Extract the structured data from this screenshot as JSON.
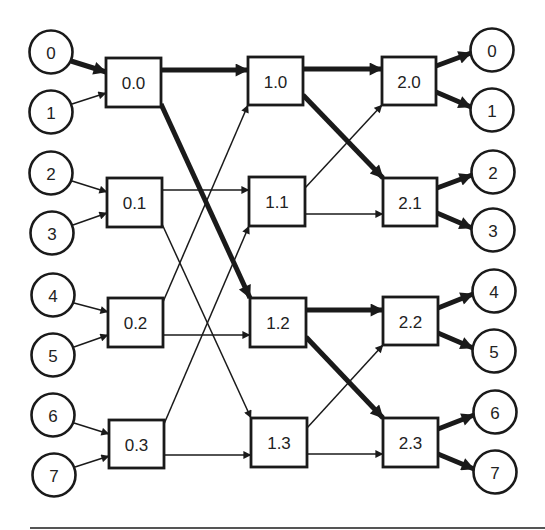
{
  "diagram": {
    "title": "",
    "type": "butterfly-network",
    "colors": {
      "stroke": "#1a1a1a",
      "fill": "#ffffff",
      "text": "#222222"
    },
    "inputs": [
      {
        "id": "in0",
        "label": "0",
        "cx": 51,
        "cy": 52
      },
      {
        "id": "in1",
        "label": "1",
        "cx": 51,
        "cy": 112
      },
      {
        "id": "in2",
        "label": "2",
        "cx": 51,
        "cy": 173
      },
      {
        "id": "in3",
        "label": "3",
        "cx": 52,
        "cy": 233
      },
      {
        "id": "in4",
        "label": "4",
        "cx": 53,
        "cy": 295
      },
      {
        "id": "in5",
        "label": "5",
        "cx": 53,
        "cy": 355
      },
      {
        "id": "in6",
        "label": "6",
        "cx": 53,
        "cy": 415
      },
      {
        "id": "in7",
        "label": "7",
        "cx": 54,
        "cy": 475
      }
    ],
    "stages": [
      {
        "name": "stage-0",
        "switches": [
          {
            "id": "s00",
            "label": "0.0",
            "x": 106,
            "y": 58,
            "w": 55,
            "h": 49
          },
          {
            "id": "s01",
            "label": "0.1",
            "x": 107,
            "y": 178,
            "w": 55,
            "h": 49
          },
          {
            "id": "s02",
            "label": "0.2",
            "x": 108,
            "y": 298,
            "w": 55,
            "h": 49
          },
          {
            "id": "s03",
            "label": "0.3",
            "x": 109,
            "y": 420,
            "w": 55,
            "h": 48
          }
        ]
      },
      {
        "name": "stage-1",
        "switches": [
          {
            "id": "s10",
            "label": "1.0",
            "x": 248,
            "y": 57,
            "w": 55,
            "h": 48
          },
          {
            "id": "s11",
            "label": "1.1",
            "x": 249,
            "y": 177,
            "w": 56,
            "h": 49
          },
          {
            "id": "s12",
            "label": "1.2",
            "x": 250,
            "y": 298,
            "w": 56,
            "h": 49
          },
          {
            "id": "s13",
            "label": "1.3",
            "x": 251,
            "y": 418,
            "w": 56,
            "h": 49
          }
        ]
      },
      {
        "name": "stage-2",
        "switches": [
          {
            "id": "s20",
            "label": "2.0",
            "x": 382,
            "y": 57,
            "w": 54,
            "h": 48
          },
          {
            "id": "s21",
            "label": "2.1",
            "x": 383,
            "y": 178,
            "w": 54,
            "h": 48
          },
          {
            "id": "s22",
            "label": "2.2",
            "x": 383,
            "y": 297,
            "w": 55,
            "h": 48
          },
          {
            "id": "s23",
            "label": "2.3",
            "x": 383,
            "y": 418,
            "w": 55,
            "h": 49
          }
        ]
      }
    ],
    "outputs": [
      {
        "id": "out0",
        "label": "0",
        "cx": 492,
        "cy": 50
      },
      {
        "id": "out1",
        "label": "1",
        "cx": 492,
        "cy": 110
      },
      {
        "id": "out2",
        "label": "2",
        "cx": 493,
        "cy": 172
      },
      {
        "id": "out3",
        "label": "3",
        "cx": 493,
        "cy": 230
      },
      {
        "id": "out4",
        "label": "4",
        "cx": 494,
        "cy": 291
      },
      {
        "id": "out5",
        "label": "5",
        "cx": 494,
        "cy": 351
      },
      {
        "id": "out6",
        "label": "6",
        "cx": 495,
        "cy": 412
      },
      {
        "id": "out7",
        "label": "7",
        "cx": 495,
        "cy": 472
      }
    ],
    "edges": [
      {
        "from": "in0",
        "to": "s00",
        "thick": true,
        "x1": 71,
        "y1": 61,
        "x2": 106,
        "y2": 72
      },
      {
        "from": "in1",
        "to": "s00",
        "thick": false,
        "x1": 72,
        "y1": 104,
        "x2": 106,
        "y2": 93
      },
      {
        "from": "in2",
        "to": "s01",
        "thick": false,
        "x1": 72,
        "y1": 181,
        "x2": 107,
        "y2": 192
      },
      {
        "from": "in3",
        "to": "s01",
        "thick": false,
        "x1": 73,
        "y1": 225,
        "x2": 107,
        "y2": 213
      },
      {
        "from": "in4",
        "to": "s02",
        "thick": false,
        "x1": 74,
        "y1": 303,
        "x2": 108,
        "y2": 312
      },
      {
        "from": "in5",
        "to": "s02",
        "thick": false,
        "x1": 74,
        "y1": 347,
        "x2": 108,
        "y2": 335
      },
      {
        "from": "in6",
        "to": "s03",
        "thick": false,
        "x1": 74,
        "y1": 423,
        "x2": 109,
        "y2": 434
      },
      {
        "from": "in7",
        "to": "s03",
        "thick": false,
        "x1": 75,
        "y1": 467,
        "x2": 109,
        "y2": 456
      },
      {
        "from": "s00",
        "to": "s10",
        "thick": true,
        "x1": 161,
        "y1": 70,
        "x2": 248,
        "y2": 70
      },
      {
        "from": "s00",
        "to": "s12",
        "thick": true,
        "x1": 161,
        "y1": 104,
        "x2": 250,
        "y2": 298
      },
      {
        "from": "s01",
        "to": "s11",
        "thick": false,
        "x1": 162,
        "y1": 190,
        "x2": 249,
        "y2": 190
      },
      {
        "from": "s01",
        "to": "s13",
        "thick": false,
        "x1": 162,
        "y1": 224,
        "x2": 251,
        "y2": 418
      },
      {
        "from": "s02",
        "to": "s10",
        "thick": false,
        "x1": 163,
        "y1": 302,
        "x2": 248,
        "y2": 105
      },
      {
        "from": "s02",
        "to": "s12",
        "thick": false,
        "x1": 163,
        "y1": 335,
        "x2": 250,
        "y2": 335
      },
      {
        "from": "s03",
        "to": "s11",
        "thick": false,
        "x1": 164,
        "y1": 424,
        "x2": 249,
        "y2": 226
      },
      {
        "from": "s03",
        "to": "s13",
        "thick": false,
        "x1": 164,
        "y1": 455,
        "x2": 251,
        "y2": 455
      },
      {
        "from": "s10",
        "to": "s20",
        "thick": true,
        "x1": 303,
        "y1": 69,
        "x2": 382,
        "y2": 69
      },
      {
        "from": "s10",
        "to": "s21",
        "thick": true,
        "x1": 303,
        "y1": 95,
        "x2": 383,
        "y2": 178
      },
      {
        "from": "s11",
        "to": "s20",
        "thick": false,
        "x1": 305,
        "y1": 188,
        "x2": 382,
        "y2": 105
      },
      {
        "from": "s11",
        "to": "s21",
        "thick": false,
        "x1": 305,
        "y1": 214,
        "x2": 383,
        "y2": 214
      },
      {
        "from": "s12",
        "to": "s22",
        "thick": true,
        "x1": 306,
        "y1": 310,
        "x2": 383,
        "y2": 310
      },
      {
        "from": "s12",
        "to": "s23",
        "thick": true,
        "x1": 306,
        "y1": 337,
        "x2": 383,
        "y2": 418
      },
      {
        "from": "s13",
        "to": "s22",
        "thick": false,
        "x1": 307,
        "y1": 428,
        "x2": 383,
        "y2": 345
      },
      {
        "from": "s13",
        "to": "s23",
        "thick": false,
        "x1": 307,
        "y1": 454,
        "x2": 383,
        "y2": 454
      },
      {
        "from": "s20",
        "to": "out0",
        "thick": true,
        "x1": 436,
        "y1": 66,
        "x2": 471,
        "y2": 53
      },
      {
        "from": "s20",
        "to": "out1",
        "thick": true,
        "x1": 436,
        "y1": 92,
        "x2": 471,
        "y2": 107
      },
      {
        "from": "s21",
        "to": "out2",
        "thick": true,
        "x1": 437,
        "y1": 188,
        "x2": 472,
        "y2": 175
      },
      {
        "from": "s21",
        "to": "out3",
        "thick": true,
        "x1": 437,
        "y1": 213,
        "x2": 472,
        "y2": 228
      },
      {
        "from": "s22",
        "to": "out4",
        "thick": true,
        "x1": 438,
        "y1": 308,
        "x2": 473,
        "y2": 294
      },
      {
        "from": "s22",
        "to": "out5",
        "thick": true,
        "x1": 438,
        "y1": 333,
        "x2": 473,
        "y2": 348
      },
      {
        "from": "s23",
        "to": "out6",
        "thick": true,
        "x1": 438,
        "y1": 429,
        "x2": 474,
        "y2": 415
      },
      {
        "from": "s23",
        "to": "out7",
        "thick": true,
        "x1": 438,
        "y1": 454,
        "x2": 474,
        "y2": 469
      }
    ],
    "rule": {
      "x1": 30,
      "y1": 528,
      "x2": 545,
      "y2": 528
    }
  }
}
